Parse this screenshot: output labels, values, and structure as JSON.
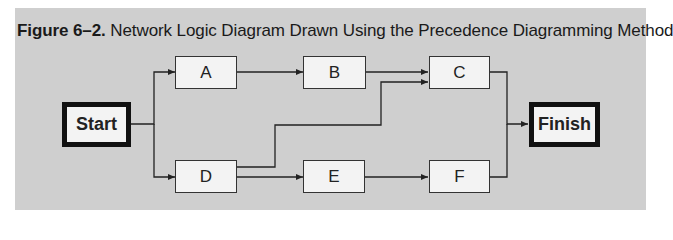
{
  "caption": {
    "figure_label": "Figure 6–2.",
    "title": "Network Logic Diagram Drawn Using the Precedence Diagramming Method"
  },
  "nodes": [
    {
      "id": "start",
      "label": "Start",
      "type": "terminal"
    },
    {
      "id": "a",
      "label": "A",
      "type": "activity"
    },
    {
      "id": "b",
      "label": "B",
      "type": "activity"
    },
    {
      "id": "c",
      "label": "C",
      "type": "activity"
    },
    {
      "id": "d",
      "label": "D",
      "type": "activity"
    },
    {
      "id": "e",
      "label": "E",
      "type": "activity"
    },
    {
      "id": "f",
      "label": "F",
      "type": "activity"
    },
    {
      "id": "finish",
      "label": "Finish",
      "type": "terminal"
    }
  ],
  "edges": [
    {
      "from": "Start",
      "to": "A"
    },
    {
      "from": "Start",
      "to": "D"
    },
    {
      "from": "A",
      "to": "B"
    },
    {
      "from": "B",
      "to": "C"
    },
    {
      "from": "D",
      "to": "C"
    },
    {
      "from": "D",
      "to": "E"
    },
    {
      "from": "E",
      "to": "F"
    },
    {
      "from": "C",
      "to": "Finish"
    },
    {
      "from": "F",
      "to": "Finish"
    }
  ],
  "colors": {
    "panel_background": "#cfcfcf",
    "node_fill": "#f3f3f3",
    "line": "#222222"
  }
}
